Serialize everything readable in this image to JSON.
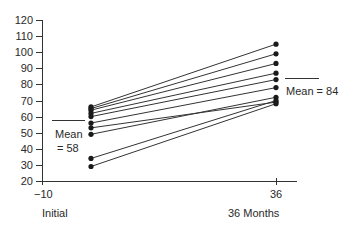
{
  "chart_data": {
    "type": "line",
    "title": "",
    "xlabel": "",
    "ylabel": "",
    "x": [
      -10,
      36
    ],
    "x_tick_labels": [
      "-10",
      "36"
    ],
    "x_category_labels": [
      "Initial",
      "36 Months"
    ],
    "y_ticks": [
      20,
      30,
      40,
      50,
      60,
      70,
      80,
      90,
      100,
      110,
      120
    ],
    "ylim": [
      20,
      120
    ],
    "grid": false,
    "legend": null,
    "series": [
      {
        "name": "Subject 1",
        "values": [
          66,
          105
        ]
      },
      {
        "name": "Subject 2",
        "values": [
          65,
          99
        ]
      },
      {
        "name": "Subject 3",
        "values": [
          64,
          93
        ]
      },
      {
        "name": "Subject 4",
        "values": [
          62,
          87
        ]
      },
      {
        "name": "Subject 5",
        "values": [
          60,
          83
        ]
      },
      {
        "name": "Subject 6",
        "values": [
          56,
          78
        ]
      },
      {
        "name": "Subject 7",
        "values": [
          53,
          69
        ]
      },
      {
        "name": "Subject 8",
        "values": [
          49,
          72
        ]
      },
      {
        "name": "Subject 9",
        "values": [
          34,
          70
        ]
      },
      {
        "name": "Subject 10",
        "values": [
          29,
          68
        ]
      }
    ],
    "annotations": [
      {
        "text": "Mean = 58",
        "at": "Initial",
        "value": 58
      },
      {
        "text": "Mean = 84",
        "at": "36 Months",
        "value": 84
      }
    ]
  },
  "labels": {
    "y_ticks": [
      "120",
      "110",
      "100",
      "90",
      "80",
      "70",
      "60",
      "50",
      "40",
      "30",
      "20"
    ],
    "x_tick_left": "−10",
    "x_tick_right": "36",
    "x_cat_left": "Initial",
    "x_cat_right": "36 Months",
    "mean_left_line1": "Mean",
    "mean_left_line2": "= 58",
    "mean_right": "Mean = 84"
  }
}
